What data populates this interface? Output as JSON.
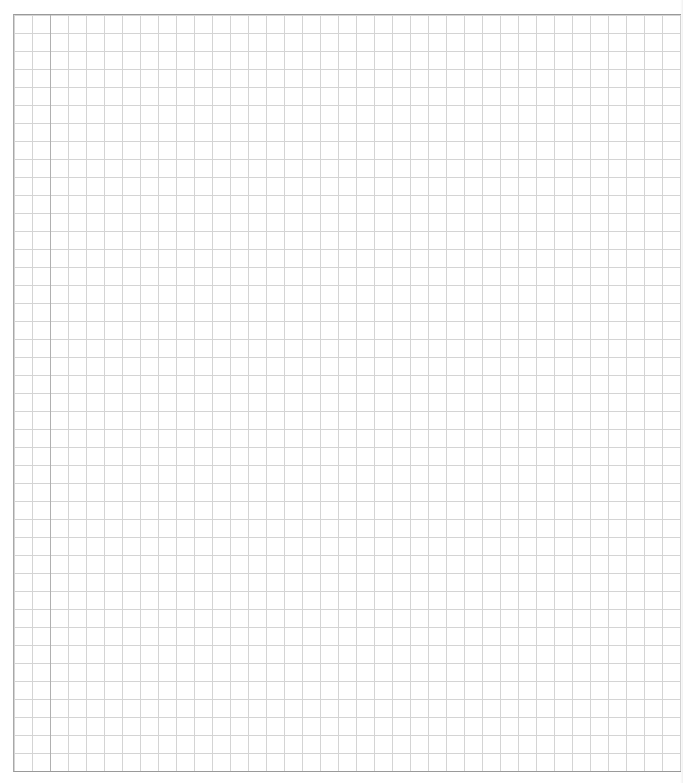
{
  "page": {
    "type": "graph-paper",
    "grid_spacing_px": 18,
    "colors": {
      "background": "#ffffff",
      "grid_line": "#d4d4d4",
      "border_line": "#9a9a9a",
      "margin_line": "#b0b0b0"
    }
  }
}
